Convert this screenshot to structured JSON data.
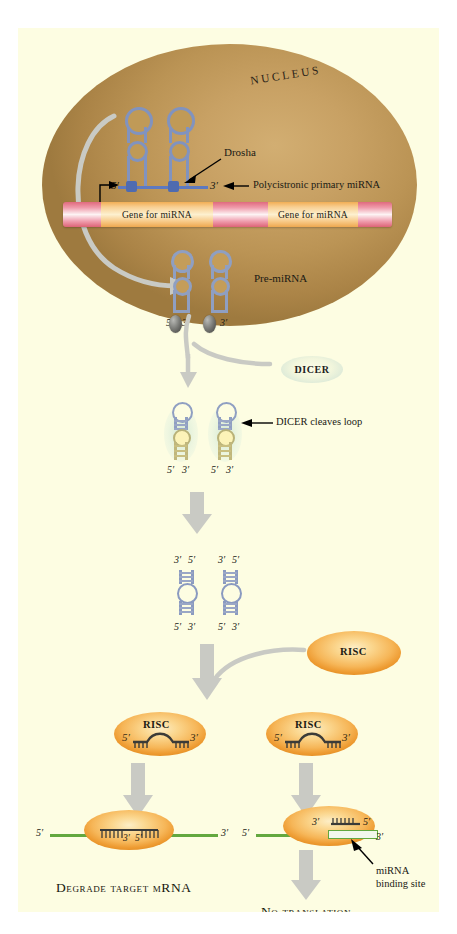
{
  "figure": {
    "background": "#fdfde2",
    "page_background": "#ffffff"
  },
  "nucleus": {
    "label": "NUCLEUS",
    "fill_center": "#d2ae72",
    "fill_edge": "#9e7a3f"
  },
  "gene_bar": {
    "segments": [
      {
        "type": "spacer",
        "label": ""
      },
      {
        "type": "gene",
        "label": "Gene for miRNA"
      },
      {
        "type": "spacer",
        "label": ""
      },
      {
        "type": "gene",
        "label": "Gene for miRNA"
      },
      {
        "type": "spacer",
        "label": ""
      }
    ],
    "gene_color": "#f2ae55",
    "spacer_color": "#e06a7e"
  },
  "pri_mirna": {
    "five_prime": "5′",
    "three_prime": "3′",
    "drosha_label": "Drosha",
    "polycistronic_label": "Polycistronic primary miRNA",
    "stem_color": "#8193bf",
    "drosha_site_color": "#4f6bb0"
  },
  "pre_mirna": {
    "label": "Pre-miRNA",
    "ends": [
      {
        "five": "5′",
        "three": "3′"
      },
      {
        "five": "5′",
        "three": "3′"
      }
    ]
  },
  "dicer": {
    "label": "DICER",
    "cleaves_label": "DICER cleaves loop",
    "glow_color": "#cee6d2",
    "bound_color": "#fcf3b8",
    "ends": [
      {
        "five": "5′",
        "three": "3′"
      },
      {
        "five": "5′",
        "three": "3′"
      }
    ]
  },
  "duplexes": [
    {
      "top_three": "3′",
      "top_five": "5′",
      "bottom_five": "5′",
      "bottom_three": "3′"
    },
    {
      "top_three": "3′",
      "top_five": "5′",
      "bottom_five": "5′",
      "bottom_three": "3′"
    }
  ],
  "risc": {
    "label": "RISC",
    "color": "#f5b055",
    "loaded": [
      {
        "label": "RISC",
        "five": "5′",
        "three": "3′"
      },
      {
        "label": "RISC",
        "five": "5′",
        "three": "3′"
      }
    ]
  },
  "outcomes": {
    "left": {
      "mrna_five": "5′",
      "mrna_three": "3′",
      "pair_three": "3′",
      "pair_five": "5′",
      "caption": "Degrade target mRNA"
    },
    "right": {
      "mrna_five": "5′",
      "mirna_three": "3′",
      "mirna_five": "5′",
      "mrna_three": "3′",
      "binding_site_label_line1": "miRNA",
      "binding_site_label_line2": "binding site",
      "caption": "No translation"
    }
  },
  "colors": {
    "mrna_green": "#63a83f",
    "rna_blue": "#8193bf",
    "arrow_grey": "#c9cac4"
  }
}
